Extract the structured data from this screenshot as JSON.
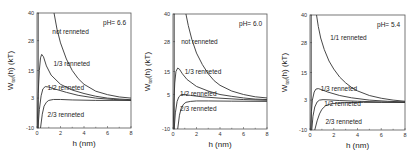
{
  "chart_data": [
    {
      "type": "line",
      "annotation": "pH= 6.6",
      "xlabel": "h (nm)",
      "ylabel": "W_tot(h) (kT)",
      "xlim": [
        0,
        8
      ],
      "ylim": [
        -10,
        40
      ],
      "xticks": [
        "0",
        "2",
        "4",
        "6",
        "8"
      ],
      "yticks": [
        "40",
        "28",
        "15",
        "3",
        "-10"
      ],
      "ytick_values": [
        40,
        28,
        15,
        3,
        -10
      ],
      "grid": false,
      "series": [
        {
          "name": "not renneted",
          "label_pos": [
            1.3,
            31
          ],
          "x": [
            1.45,
            1.7,
            2.0,
            2.5,
            3.0,
            3.5,
            4.0,
            5.0,
            6.0,
            7.0,
            8.0
          ],
          "y": [
            40,
            33,
            27,
            20,
            15,
            11.5,
            9,
            6,
            4.5,
            3.5,
            3
          ]
        },
        {
          "name": "1/3 renneted",
          "label_pos": [
            1.4,
            17
          ],
          "x": [
            0.02,
            0.1,
            0.2,
            0.3,
            0.4,
            0.55,
            0.8,
            1.2,
            2.0,
            3.0,
            4.0,
            5.0,
            6.0,
            7.0,
            8.0
          ],
          "y": [
            -10,
            5,
            15,
            20.5,
            22,
            21,
            17,
            13,
            9,
            6.5,
            5,
            3.8,
            3,
            2.6,
            2.3
          ]
        },
        {
          "name": "1/2 renneted",
          "label_pos": [
            0.9,
            6.5
          ],
          "x": [
            0.08,
            0.2,
            0.35,
            0.5,
            0.7,
            1.0,
            1.5,
            2.5,
            3.5,
            5.0,
            6.5,
            8.0
          ],
          "y": [
            -10,
            -2,
            4,
            7,
            8,
            7.8,
            7,
            5.5,
            4.2,
            3,
            2.4,
            2
          ]
        },
        {
          "name": "2/3 renneted",
          "label_pos": [
            0.9,
            -5
          ],
          "x": [
            0.3,
            0.45,
            0.6,
            0.8,
            1.0,
            1.4,
            2.0,
            3.0,
            5.0,
            8.0
          ],
          "y": [
            -10,
            -4,
            -0.5,
            1.2,
            2,
            2.4,
            2.4,
            2.2,
            2,
            2
          ]
        }
      ]
    },
    {
      "type": "line",
      "annotation": "pH= 6.0",
      "xlabel": "h (nm)",
      "ylabel": "W_tot(h) (kT)",
      "xlim": [
        0,
        8
      ],
      "ylim": [
        -10,
        40
      ],
      "xticks": [
        "0",
        "2",
        "4",
        "6",
        "8"
      ],
      "yticks": [
        "40",
        "28",
        "15",
        "5",
        "-10"
      ],
      "ytick_values": [
        40,
        28,
        15,
        5,
        -10
      ],
      "grid": false,
      "series": [
        {
          "name": "not renneted",
          "label_pos": [
            0.7,
            27
          ],
          "x": [
            1.1,
            1.3,
            1.6,
            2.0,
            2.5,
            3.0,
            3.5,
            4.0,
            5.0,
            6.0,
            7.0,
            8.0
          ],
          "y": [
            40,
            35,
            29,
            23,
            18,
            14,
            11,
            9,
            6.5,
            5,
            4,
            3.5
          ]
        },
        {
          "name": "1/3 renneted",
          "label_pos": [
            1.0,
            14
          ],
          "x": [
            0.02,
            0.08,
            0.15,
            0.25,
            0.4,
            0.55,
            0.8,
            1.2,
            2.0,
            3.0,
            4.0,
            5.0,
            6.0,
            7.0,
            8.0
          ],
          "y": [
            -10,
            2,
            10,
            15,
            16.5,
            16,
            14,
            11.5,
            8.5,
            6.5,
            5,
            4.2,
            3.5,
            3,
            2.8
          ]
        },
        {
          "name": "1/2 renneted",
          "label_pos": [
            0.6,
            4.5
          ],
          "x": [
            0.1,
            0.2,
            0.35,
            0.5,
            0.7,
            1.0,
            1.5,
            2.5,
            4.0,
            6.0,
            8.0
          ],
          "y": [
            -10,
            -3,
            2,
            4,
            5,
            5,
            4.6,
            4,
            3.4,
            2.8,
            2.5
          ]
        },
        {
          "name": "2/3 renneted",
          "label_pos": [
            0.6,
            -2
          ],
          "x": [
            0.4,
            0.55,
            0.7,
            0.9,
            1.1,
            1.5,
            2.0,
            3.0,
            5.0,
            8.0
          ],
          "y": [
            -10,
            -4,
            -1,
            0.8,
            1.6,
            2,
            2.2,
            2.2,
            2.1,
            2
          ]
        }
      ]
    },
    {
      "type": "line",
      "annotation": "pH= 5.4",
      "xlabel": "h (nm)",
      "ylabel": "W_tot(h) (kT)",
      "xlim": [
        0,
        8
      ],
      "ylim": [
        -10,
        40
      ],
      "xticks": [
        "0",
        "2",
        "4",
        "6",
        "8"
      ],
      "yticks": [
        "40",
        "28",
        "15",
        "3",
        "-10"
      ],
      "ytick_values": [
        40,
        28,
        15,
        3,
        -10
      ],
      "grid": false,
      "series": [
        {
          "name": "1/1 renneted",
          "label_pos": [
            1.7,
            29
          ],
          "x": [
            0.55,
            0.7,
            0.9,
            1.2,
            1.6,
            2.0,
            2.5,
            3.0,
            3.5,
            4.0,
            5.0,
            6.0,
            7.0,
            8.0
          ],
          "y": [
            40,
            35,
            30,
            25,
            20,
            16.5,
            13,
            10.5,
            8.5,
            7,
            5,
            3.8,
            3,
            2.5
          ]
        },
        {
          "name": "1/3 renneted",
          "label_pos": [
            0.9,
            7
          ],
          "x": [
            0.05,
            0.12,
            0.2,
            0.35,
            0.5,
            0.7,
            1.0,
            1.5,
            2.5,
            3.5,
            5.0,
            6.5,
            8.0
          ],
          "y": [
            -10,
            -2,
            3,
            6.5,
            7.8,
            8,
            7.5,
            6.5,
            5,
            4,
            3,
            2.5,
            2.2
          ]
        },
        {
          "name": "1/2 renneted",
          "label_pos": [
            1.2,
            0.5
          ],
          "x": [
            0.15,
            0.25,
            0.4,
            0.6,
            0.8,
            1.1,
            1.6,
            2.5,
            4.0,
            6.0,
            8.0
          ],
          "y": [
            -10,
            -4,
            0,
            2.2,
            3,
            3.2,
            3.1,
            2.8,
            2.5,
            2.2,
            2
          ]
        },
        {
          "name": "2/3 renneted",
          "label_pos": [
            1.3,
            -7.5
          ],
          "x": [
            0.4,
            0.6,
            0.8,
            1.0,
            1.3,
            1.7,
            2.3,
            3.0,
            4.5,
            6.0,
            8.0
          ],
          "y": [
            -10,
            -6,
            -3,
            -1,
            0.5,
            1.3,
            1.7,
            1.9,
            2,
            2,
            2
          ]
        }
      ]
    }
  ],
  "panels_layout": [
    {
      "frame": [
        37,
        13,
        131,
        128
      ],
      "ylabel_x": 13
    },
    {
      "frame": [
        173,
        14,
        267,
        129
      ],
      "ylabel_x": 150
    },
    {
      "frame": [
        310,
        15,
        405,
        130
      ],
      "ylabel_x": 287
    }
  ]
}
